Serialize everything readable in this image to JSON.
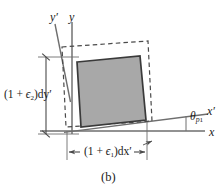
{
  "figure": {
    "caption": "(b)",
    "background_color": "#ffffff",
    "element_fill_color": "#a8a8a8",
    "element_stroke_color": "#3a3a3a",
    "axis_color": "#6e6e6e",
    "dashed_color": "#4a4a4a",
    "dimension_color": "#4a4a4a"
  },
  "axes": [
    {
      "name": "y-prime-axis",
      "label": "y",
      "prime": "′",
      "type": "rotated"
    },
    {
      "name": "y-axis",
      "label": "y",
      "prime": "",
      "type": "original"
    },
    {
      "name": "x-prime-axis",
      "label": "x",
      "prime": "′",
      "type": "rotated"
    },
    {
      "name": "x-axis",
      "label": "x",
      "prime": "",
      "type": "original"
    }
  ],
  "labels": {
    "y_prime": "y′",
    "y": "y",
    "x_prime": "x′",
    "x": "x",
    "theta": "θ",
    "theta_sub": "p",
    "theta_subsub": "1",
    "vertical_dim_open": "(1 + ",
    "vertical_dim_eps": "ϵ",
    "vertical_dim_eps_sub": "2",
    "vertical_dim_close": ")dy′",
    "horizontal_dim_open": "(1 + ",
    "horizontal_dim_eps": "ϵ",
    "horizontal_dim_eps_sub": "1",
    "horizontal_dim_close": ")dx′"
  },
  "geometry": {
    "origin": {
      "x": 72,
      "y": 131
    },
    "rotation_angle_deg": 7,
    "deformed_element": {
      "points": "77,62 140,56 146,120 81,127",
      "description": "shaded-parallelogram"
    },
    "undeformed_outline": {
      "points": "62,47 148,41 152,121 66,127",
      "description": "dashed-rectangle"
    },
    "vertical_dimension": {
      "x": 46,
      "y_top": 57,
      "y_bottom": 134
    },
    "horizontal_dimension": {
      "y": 152,
      "x_left": 67,
      "x_right": 147
    }
  }
}
